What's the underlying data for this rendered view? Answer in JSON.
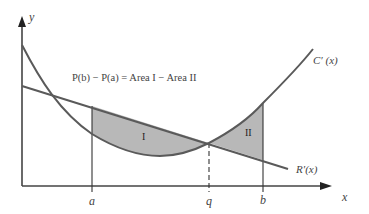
{
  "diagram": {
    "axis_labels": {
      "y": "y",
      "x": "x"
    },
    "tick_labels": {
      "a": "a",
      "q": "q",
      "b": "b"
    },
    "equation": "P(b) − P(a) = Area I − Area II",
    "curve_labels": {
      "cost": "C′ (x)",
      "revenue": "R′(x)"
    },
    "region_labels": {
      "region1": "I",
      "region2": "II"
    },
    "colors": {
      "curve": "#5a5a5a",
      "fill": "#b8b8b8",
      "axis": "#333333"
    }
  }
}
